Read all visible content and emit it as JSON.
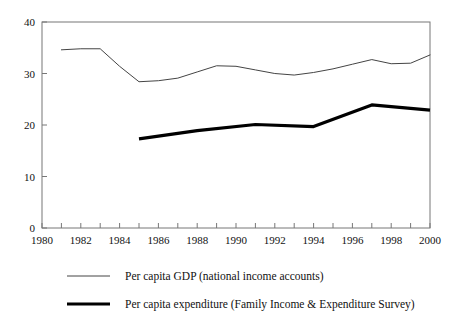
{
  "chart_data": {
    "type": "line",
    "title": "",
    "xlabel": "",
    "ylabel": "",
    "xlim": [
      1980,
      2000
    ],
    "ylim": [
      0,
      40
    ],
    "ytick_values": [
      0,
      10,
      20,
      30,
      40
    ],
    "ytick_labels": [
      "0",
      "10",
      "20",
      "30",
      "40"
    ],
    "xtick_values": [
      1980,
      1981,
      1982,
      1983,
      1984,
      1985,
      1986,
      1987,
      1988,
      1989,
      1990,
      1991,
      1992,
      1993,
      1994,
      1995,
      1996,
      1997,
      1998,
      1999,
      2000
    ],
    "xtick_labels_shown": [
      "1980",
      "1982",
      "1984",
      "1986",
      "1988",
      "1990",
      "1992",
      "1994",
      "1996",
      "1998",
      "2000"
    ],
    "grid": false,
    "legend_position": "below",
    "frame": "box",
    "series": [
      {
        "name": "Per capita GDP (national income accounts)",
        "style": "thin",
        "color": "#444444",
        "linewidth": 1,
        "x": [
          1981,
          1982,
          1983,
          1984,
          1985,
          1986,
          1987,
          1988,
          1989,
          1990,
          1991,
          1992,
          1993,
          1994,
          1995,
          1996,
          1997,
          1998,
          1999,
          2000
        ],
        "values": [
          34.6,
          34.8,
          34.8,
          31.4,
          28.4,
          28.6,
          29.1,
          30.3,
          31.5,
          31.4,
          30.7,
          30.0,
          29.7,
          30.2,
          30.9,
          31.8,
          32.7,
          31.9,
          32.0,
          33.6
        ]
      },
      {
        "name": "Per capita expenditure (Family Income & Expenditure Survey)",
        "style": "thick",
        "color": "#000000",
        "linewidth": 3,
        "x": [
          1985,
          1988,
          1991,
          1994,
          1997,
          2000
        ],
        "values": [
          17.3,
          18.9,
          20.1,
          19.7,
          23.9,
          22.9
        ]
      }
    ]
  },
  "legend": {
    "items": [
      {
        "label": "Per capita GDP (national income accounts)",
        "style": "thin"
      },
      {
        "label": "Per capita expenditure (Family Income & Expenditure Survey)",
        "style": "thick"
      }
    ]
  }
}
